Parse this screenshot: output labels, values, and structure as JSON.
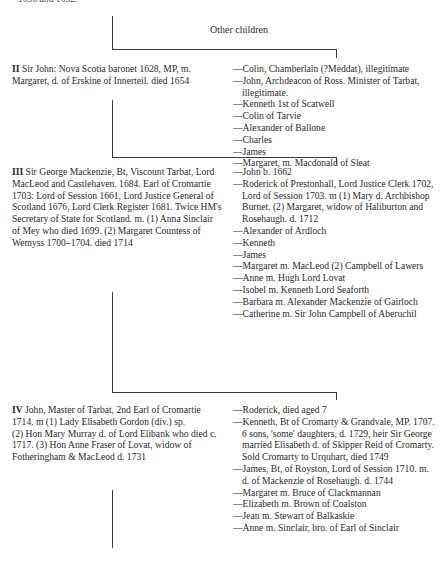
{
  "cutoff_text": "1650 and 1652.",
  "other_children_label": "Other children",
  "generations": [
    {
      "numeral": "II",
      "text": "Sir John: Nova Scotia baronet 1628, MP, m. Margaret, d. of Erskine of Innerteil. died 1654",
      "children": [
        "Colin, Chamberlain (?Meddat), illegitimate",
        "John, Archdeacon of Ross. Minister of Tarbat, illegitimate.",
        "Kenneth 1st of Scatwell",
        "Colin of Tarvie",
        "Alexander of Ballone",
        "Charles",
        "James",
        "Margaret, m. Macdonald of Sleat"
      ]
    },
    {
      "numeral": "III",
      "text": "Sir George Mackenzie, Bt, Viscount Tarbat, Lord MacLeod and Castlehaven. 1684. Earl of Cromartie 1703: Lord of Session 1661, Lord Justice General of Scotland 1676, Lord Clerk Register 1681. Twice HM's Secretary of State for Scotland. m. (1) Anna Sinclair of Mey who died 1699. (2) Margaret Countess of Wemyss 1700–1704. died 1714",
      "children": [
        "John b. 1662",
        "Roderick of Prestonhall, Lord Justice Clerk 1702, Lord of Session 1703. m (1) Mary d. Archbishop Burnet. (2) Margaret, widow of Haliburton and Rosehaugh. d. 1712",
        "Alexander of Ardloch",
        "Kenneth",
        "James",
        "Margaret m. MacLeod (2) Campbell of Lawers",
        "Anne m. Hugh Lord Lovat",
        "Isobel m. Kenneth Lord Seaforth",
        "Barbara m. Alexander Mackenzie of Gairloch",
        "Catherine m. Sir John Campbell of Aberuchil"
      ]
    },
    {
      "numeral": "IV",
      "text_lines": [
        "John, Master of Tarbat, 2nd Earl of Cromartie 1714. m (1) Lady Elisabeth Gordon (div.) sp.",
        "(2) Hon Mary Murray d. of Lord Elibank who died c. 1717. (3) Hon Anne Fraser of Lovat, widow of Fotheringham & MacLeod d. 1731"
      ],
      "children": [
        "Roderick, died aged 7",
        "Kenneth, Bt of Cromarty & Grandvale, MP. 1707. 6 sons, 'some' daughters, d. 1729, heir Sir George married Elisabeth d. of Skipper Reid of Cromarty. Sold Cromarty to Urquhart, died 1749",
        "James, Bt, of Royston, Lord of Session 1710. m. d. of Mackenzie of Rosehaugh. d. 1744",
        "Margaret m. Bruce of Clackmannan",
        "Elizabeth m. Brown of Coalston",
        "Jean m. Stewart of Balkaskie",
        "Anne m. Sinclair, bro. of Earl of Sinclair"
      ]
    }
  ]
}
